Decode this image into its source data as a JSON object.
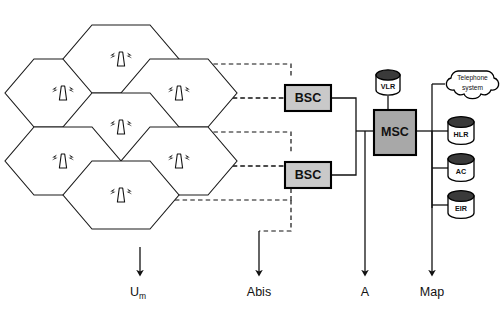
{
  "diagram": {
    "canvas": {
      "width": 501,
      "height": 317,
      "background": "#ffffff"
    }
  },
  "colors": {
    "line": "#111111",
    "cell_fill": "#ffffff",
    "bsc_fill": "#c9c9c9",
    "msc_fill": "#a8a8a8",
    "cylinder_top": "#3a3a3a",
    "cylinder_body": "#ffffff"
  },
  "cells": [
    {
      "id": "cell-1",
      "icon": "antenna-icon",
      "cx": 63,
      "cy": 93
    },
    {
      "id": "cell-2",
      "icon": "antenna-icon",
      "cx": 121,
      "cy": 59
    },
    {
      "id": "cell-3",
      "icon": "antenna-icon",
      "cx": 179,
      "cy": 93
    },
    {
      "id": "cell-4",
      "icon": "antenna-icon",
      "cx": 121,
      "cy": 127
    },
    {
      "id": "cell-5",
      "icon": "antenna-icon",
      "cx": 63,
      "cy": 161
    },
    {
      "id": "cell-6",
      "icon": "antenna-icon",
      "cx": 179,
      "cy": 161
    },
    {
      "id": "cell-7",
      "icon": "antenna-icon",
      "cx": 121,
      "cy": 195
    }
  ],
  "nodes": {
    "bsc_top": {
      "label": "BSC"
    },
    "bsc_bottom": {
      "label": "BSC"
    },
    "msc": {
      "label": "MSC"
    },
    "vlr": {
      "label": "VLR"
    },
    "hlr": {
      "label": "HLR"
    },
    "ac": {
      "label": "AC"
    },
    "eir": {
      "label": "EIR"
    },
    "telephone": {
      "label_line1": "Telephone",
      "label_line2": "system"
    }
  },
  "interfaces": [
    {
      "id": "um",
      "label": "U",
      "subscript": "m",
      "x": 140,
      "arrow_top": 247,
      "arrow_bottom": 275
    },
    {
      "id": "abis",
      "label": "Abis",
      "subscript": "",
      "x": 259,
      "arrow_top": 235,
      "arrow_bottom": 275
    },
    {
      "id": "a",
      "label": "A",
      "subscript": "",
      "x": 365,
      "arrow_top": 150,
      "arrow_bottom": 275
    },
    {
      "id": "map",
      "label": "Map",
      "subscript": "",
      "x": 432,
      "arrow_top": 150,
      "arrow_bottom": 275
    }
  ]
}
